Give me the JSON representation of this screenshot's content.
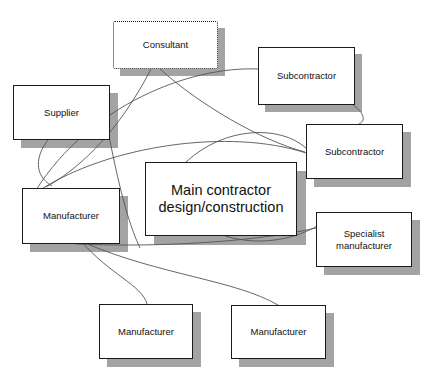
{
  "diagram": {
    "type": "relationship-network-diagram",
    "background_color": "#ffffff",
    "line_color": "#555555",
    "box_border_color": "#1a1a1a",
    "shadow_color": "#a3a3a3",
    "nodes": [
      {
        "id": "consultant",
        "label": "Consultant",
        "border_style": "dotted",
        "x": 113,
        "y": 21,
        "w": 105,
        "h": 48,
        "shadow_dx": 7,
        "shadow_dy": 7,
        "font": "sm"
      },
      {
        "id": "subcontractor-top",
        "label": "Subcontractor",
        "border_style": "solid",
        "x": 258,
        "y": 47,
        "w": 97,
        "h": 58,
        "shadow_dx": 7,
        "shadow_dy": 7,
        "font": "sm"
      },
      {
        "id": "supplier",
        "label": "Supplier",
        "border_style": "solid",
        "x": 13,
        "y": 85,
        "w": 97,
        "h": 55,
        "shadow_dx": 8,
        "shadow_dy": 8,
        "font": "sm"
      },
      {
        "id": "subcontractor-right",
        "label": "Subcontractor",
        "border_style": "solid",
        "x": 306,
        "y": 124,
        "w": 97,
        "h": 55,
        "shadow_dx": 8,
        "shadow_dy": 8,
        "font": "sm"
      },
      {
        "id": "main-contractor",
        "label": "Main contractor\ndesign/construction",
        "border_style": "solid",
        "x": 145,
        "y": 162,
        "w": 152,
        "h": 74,
        "shadow_dx": 9,
        "shadow_dy": 9,
        "font": "md"
      },
      {
        "id": "manufacturer-left",
        "label": "Manufacturer",
        "border_style": "solid",
        "x": 22,
        "y": 188,
        "w": 98,
        "h": 56,
        "shadow_dx": 8,
        "shadow_dy": 8,
        "font": "sm"
      },
      {
        "id": "specialist-manufacturer",
        "label": "Specialist\nmanufacturer",
        "border_style": "solid",
        "x": 316,
        "y": 212,
        "w": 96,
        "h": 55,
        "shadow_dx": 8,
        "shadow_dy": 8,
        "font": "sm"
      },
      {
        "id": "manufacturer-bottom-left",
        "label": "Manufacturer",
        "border_style": "solid",
        "x": 99,
        "y": 304,
        "w": 94,
        "h": 55,
        "shadow_dx": 8,
        "shadow_dy": 8,
        "font": "sm"
      },
      {
        "id": "manufacturer-bottom-right",
        "label": "Manufacturer",
        "border_style": "solid",
        "x": 231,
        "y": 305,
        "w": 95,
        "h": 54,
        "shadow_dx": 8,
        "shadow_dy": 8,
        "font": "sm"
      }
    ],
    "connectors": [
      {
        "id": "c1",
        "from": "consultant",
        "to": "manufacturer-left",
        "path": "M 151 69 C 130 110, 95 160, 46 187"
      },
      {
        "id": "c2",
        "from": "consultant",
        "to": "subcontractor-right",
        "path": "M 160 69 C 200 105, 260 140, 305 152"
      },
      {
        "id": "c3",
        "from": "supplier",
        "to": "manufacturer-left",
        "path": "M 48 140 C 36 155, 33 175, 52 186"
      },
      {
        "id": "c4",
        "from": "supplier-arc",
        "to": "subcontractor-top",
        "path": "M 36 190 C 90 105, 190 66, 258 69"
      },
      {
        "id": "c5",
        "from": "manufacturer-left",
        "to": "subcontractor-right",
        "path": "M 40 190 C 110 145, 230 128, 306 153"
      },
      {
        "id": "c6",
        "from": "subcontractor-top",
        "to": "subcontractor-right",
        "path": "M 352 104 C 368 116, 366 124, 352 126"
      },
      {
        "id": "c7",
        "from": "main-contractor",
        "to": "subcontractor-right",
        "path": "M 186 162 C 225 126, 280 125, 306 148"
      },
      {
        "id": "c8",
        "from": "main-contractor",
        "to": "specialist-manufacturer",
        "path": "M 225 236 C 265 248, 300 236, 317 226"
      },
      {
        "id": "c9",
        "from": "manufacturer-left",
        "to": "specialist-manufacturer",
        "path": "M 76 244 C 170 248, 265 240, 316 228"
      },
      {
        "id": "c10",
        "from": "manufacturer-left",
        "to": "manufacturer-bottom-left",
        "path": "M 80 240 C 110 275, 142 285, 147 304"
      },
      {
        "id": "c11",
        "from": "manufacturer-left",
        "to": "manufacturer-bottom-right",
        "path": "M 85 243 C 160 275, 235 280, 278 305"
      },
      {
        "id": "c12",
        "from": "supplier",
        "to": "main-contractor-left",
        "path": "M 99 86 C 112 150, 122 210, 140 248"
      }
    ]
  }
}
